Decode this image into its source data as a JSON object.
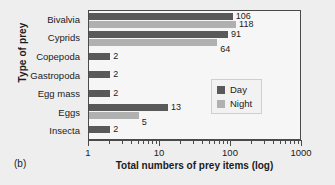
{
  "panel_label": "(b)",
  "colors": {
    "day": "#595959",
    "night": "#b0b0b0",
    "axis": "#4a4a4a",
    "plot_background": "#f6f6f6",
    "figure_background": "#eeeeee",
    "text": "#1b1b1b"
  },
  "legend": {
    "position": "center-right",
    "entries": [
      {
        "label": "Day",
        "color_key": "day"
      },
      {
        "label": "Night",
        "color_key": "night"
      }
    ]
  },
  "axes": {
    "xlabel": "Total numbers of prey items (log)",
    "ylabel": "Type of prey",
    "x_ticks": [
      "1",
      "10",
      "100",
      "1000"
    ],
    "x_scale": "log",
    "xlim": [
      1,
      1000
    ],
    "grid": false
  },
  "chart_data": {
    "type": "bar",
    "orientation": "horizontal",
    "title": "",
    "xlabel": "Total numbers of prey items (log)",
    "ylabel": "Type of prey",
    "xscale": "log",
    "xlim": [
      1,
      1000
    ],
    "xticks": [
      1,
      10,
      100,
      1000
    ],
    "xticklabels": [
      "1",
      "10",
      "100",
      "1000"
    ],
    "grid": false,
    "legend_position": "center-right",
    "categories": [
      "Bivalvia",
      "Cyprids",
      "Copepoda",
      "Gastropoda",
      "Egg mass",
      "Eggs",
      "Insecta"
    ],
    "series": [
      {
        "name": "Day",
        "color": "#595959",
        "values": [
          106,
          91,
          2,
          2,
          2,
          13,
          2
        ],
        "labels": [
          "106",
          "91",
          "2",
          "2",
          "2",
          "13",
          "2"
        ]
      },
      {
        "name": "Night",
        "color": "#b0b0b0",
        "values": [
          118,
          64,
          null,
          null,
          null,
          5,
          null
        ],
        "labels": [
          "118",
          "64",
          "",
          "",
          "",
          "5",
          ""
        ]
      }
    ]
  }
}
